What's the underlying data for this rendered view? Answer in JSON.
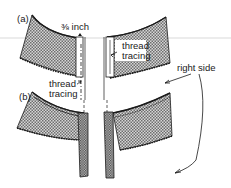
{
  "diagram": {
    "type": "sewing-instruction-illustration",
    "panels": [
      {
        "id": "a",
        "label": "(a)"
      },
      {
        "id": "b",
        "label": "(b)"
      }
    ],
    "labels": {
      "panel_a": "(a)",
      "panel_b": "(b)",
      "seam_allowance": "⅜ inch",
      "thread_tracing_left_line1": "thread",
      "thread_tracing_left_line2": "tracing",
      "thread_tracing_right_line1": "thread",
      "thread_tracing_right_line2": "tracing",
      "right_side": "right side"
    },
    "colors": {
      "ink": "#1a1a1a",
      "fabric_fill": "#b8b8b8",
      "background": "#ffffff",
      "guide_line": "#c8c8c8"
    }
  }
}
